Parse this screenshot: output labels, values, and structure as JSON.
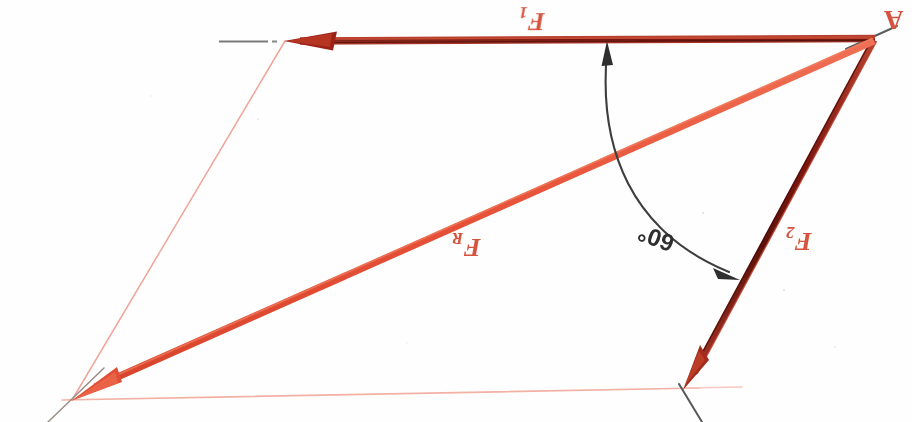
{
  "diagram": {
    "orientation_note": "all hand-written labels appear rotated 180 degrees",
    "canvas": {
      "width": 912,
      "height": 422,
      "background": "#fefefe"
    },
    "colors": {
      "force_dark": "#8f1d16",
      "force_dark_core": "#5d1109",
      "resultant": "#e8533a",
      "construction": "#f1a59a",
      "construction_faint": "#f6c3bb",
      "arc": "#3a3a3a",
      "pencil": "#6b6b6b",
      "label_red": "#d6543d",
      "label_dark": "#2e2e2e"
    },
    "points": {
      "A": {
        "label": "A",
        "x": 875,
        "y": 38
      },
      "F1_tip": {
        "x": 285,
        "y": 41
      },
      "F2_tip": {
        "x": 683,
        "y": 388
      },
      "FR_tip": {
        "x": 72,
        "y": 400
      }
    },
    "vectors": [
      {
        "name": "F1",
        "label": "F",
        "subscript": "1",
        "label_x": 529,
        "label_y": 22,
        "from": "A",
        "to": "F1_tip",
        "color": "#8f1d16",
        "width": 7,
        "arrowhead": "filled-triangle"
      },
      {
        "name": "F2",
        "label": "F",
        "subscript": "2",
        "label_x": 797,
        "label_y": 243,
        "from": "A",
        "to": "F2_tip",
        "color": "#8f1d16",
        "width": 7,
        "arrowhead": "filled-triangle"
      },
      {
        "name": "FR",
        "label": "F",
        "subscript": "R",
        "label_x": 464,
        "label_y": 248,
        "from": "A",
        "to": "FR_tip",
        "color": "#e8533a",
        "width": 7,
        "arrowhead": "filled-triangle"
      }
    ],
    "angle": {
      "name": "angle-between-F1-and-F2",
      "value": "60°",
      "label_x": 659,
      "label_y": 243,
      "arc_color": "#3a3a3a",
      "arrow_ends": "both",
      "at_point": "A"
    },
    "construction_lines": [
      {
        "name": "parallelogram-left-side",
        "from_x": 285,
        "from_y": 41,
        "to_x": 72,
        "to_y": 400
      },
      {
        "name": "parallelogram-bottom-side",
        "from_x": 72,
        "from_y": 400,
        "to_x": 683,
        "to_y": 388
      },
      {
        "name": "baseline-extension-right",
        "from_x": 683,
        "from_y": 388,
        "to_x": 700,
        "to_y": 388
      },
      {
        "name": "f1-axis-extension-left",
        "from_x": 285,
        "from_y": 41,
        "to_x": 218,
        "to_y": 41
      },
      {
        "name": "f2-axis-extension-below",
        "from_x": 683,
        "from_y": 388,
        "to_x": 700,
        "to_y": 418
      }
    ]
  }
}
